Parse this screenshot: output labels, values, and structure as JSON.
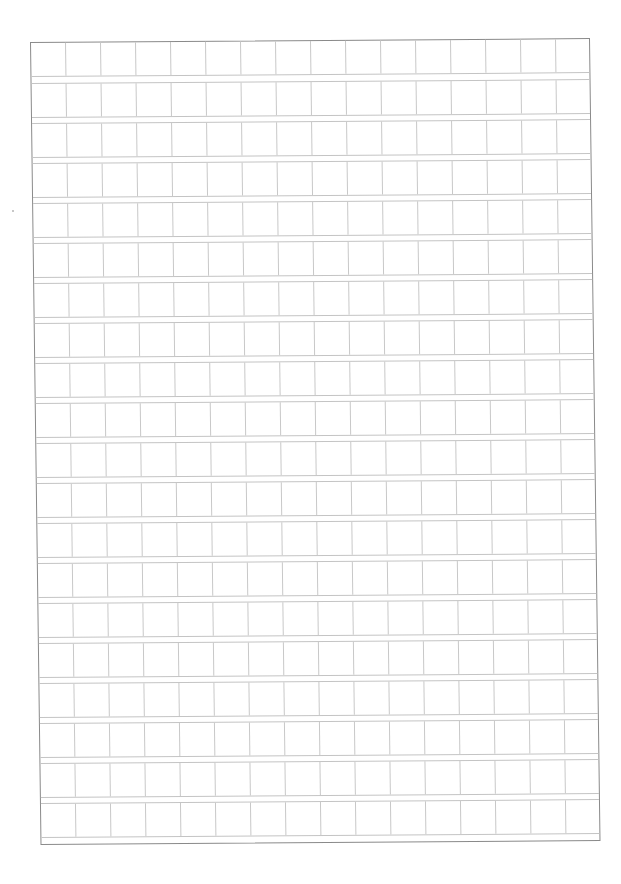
{
  "document": {
    "type": "manuscript-grid-paper",
    "rows": 20,
    "columns": 16,
    "row_pitch_px": 40,
    "cell_height_px": 34,
    "column_pitch_px": 35,
    "colors": {
      "background": "#ffffff",
      "outer_border": "#8a8a8a",
      "grid_lines": "#c4c4c4"
    }
  }
}
